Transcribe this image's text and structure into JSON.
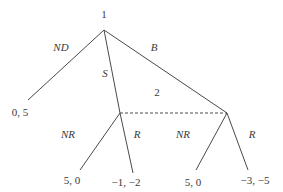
{
  "diagram": {
    "type": "extensive-form game tree",
    "nodes": {
      "root": {
        "player_label": "1",
        "x": 104,
        "y": 30
      },
      "left_decision": {
        "x": 120,
        "y": 113
      },
      "right_decision": {
        "x": 227,
        "y": 113
      }
    },
    "info_set": {
      "player_label": "2",
      "label_x": 157,
      "label_y": 96
    },
    "player1_actions": [
      {
        "label": "ND",
        "to": [
          28,
          100
        ],
        "label_pos": [
          52,
          50
        ]
      },
      {
        "label": "S",
        "to": [
          120,
          113
        ],
        "label_pos": [
          101,
          76
        ]
      },
      {
        "label": "B",
        "to": [
          227,
          113
        ],
        "label_pos": [
          150,
          50
        ]
      }
    ],
    "player2_actions_left": [
      {
        "label": "NR",
        "to": [
          80,
          170
        ],
        "label_pos": [
          61,
          137
        ]
      },
      {
        "label": "R",
        "to": [
          133,
          173
        ],
        "label_pos": [
          134,
          137
        ]
      }
    ],
    "player2_actions_right": [
      {
        "label": "NR",
        "to": [
          196,
          170
        ],
        "label_pos": [
          176,
          137
        ]
      },
      {
        "label": "R",
        "to": [
          248,
          170
        ],
        "label_pos": [
          249,
          137
        ]
      }
    ],
    "payoffs": [
      {
        "text": "0, 5",
        "pos": [
          11,
          116
        ]
      },
      {
        "text": "5, 0",
        "pos": [
          65,
          184
        ]
      },
      {
        "text": "−1, −2",
        "pos": [
          112,
          186
        ]
      },
      {
        "text": "5, 0",
        "pos": [
          186,
          186
        ]
      },
      {
        "text": "−3, −5",
        "pos": [
          241,
          184
        ]
      }
    ]
  }
}
